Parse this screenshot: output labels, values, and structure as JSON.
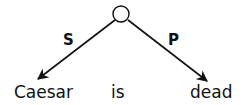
{
  "diagram": {
    "type": "dependency-tree",
    "root_node": {
      "shape": "circle",
      "label": ""
    },
    "edges": [
      {
        "label": "S",
        "target": "Caesar"
      },
      {
        "label": "P",
        "target": "dead"
      }
    ],
    "words": [
      "Caesar",
      "is",
      "dead"
    ],
    "colors": {
      "ink": "#111111",
      "background": "#ffffff"
    }
  }
}
